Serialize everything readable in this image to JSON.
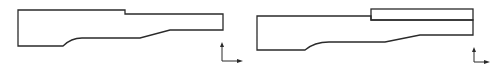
{
  "diagram": {
    "figures": [
      {
        "id": "profile-left",
        "stroke": "#2a2a2a",
        "path": "M18,10 L125,10 L125,14 L223,14 L223,30 L170,30 L140,38 L82,38 C74,38 68,41 63,46 L18,46 Z",
        "inner_rect": null,
        "axis": {
          "origin": [
            222,
            61
          ],
          "up_to": [
            222,
            43
          ],
          "right_to": [
            242,
            61
          ]
        }
      },
      {
        "id": "profile-right",
        "stroke": "#2a2a2a",
        "path": "M257,16 L371,16 L371,20 L473,20 L473,35 L420,35 L385,42 L329,42 C320,42 312,44 305,50 L257,50 Z",
        "inner_rect": {
          "x": 371,
          "y": 9,
          "width": 102,
          "height": 11
        },
        "axis": {
          "origin": [
            474,
            62
          ],
          "up_to": [
            474,
            48
          ],
          "right_to": [
            489,
            62
          ]
        }
      }
    ],
    "colors": {
      "line": "#2a2a2a",
      "background": "#ffffff"
    }
  }
}
